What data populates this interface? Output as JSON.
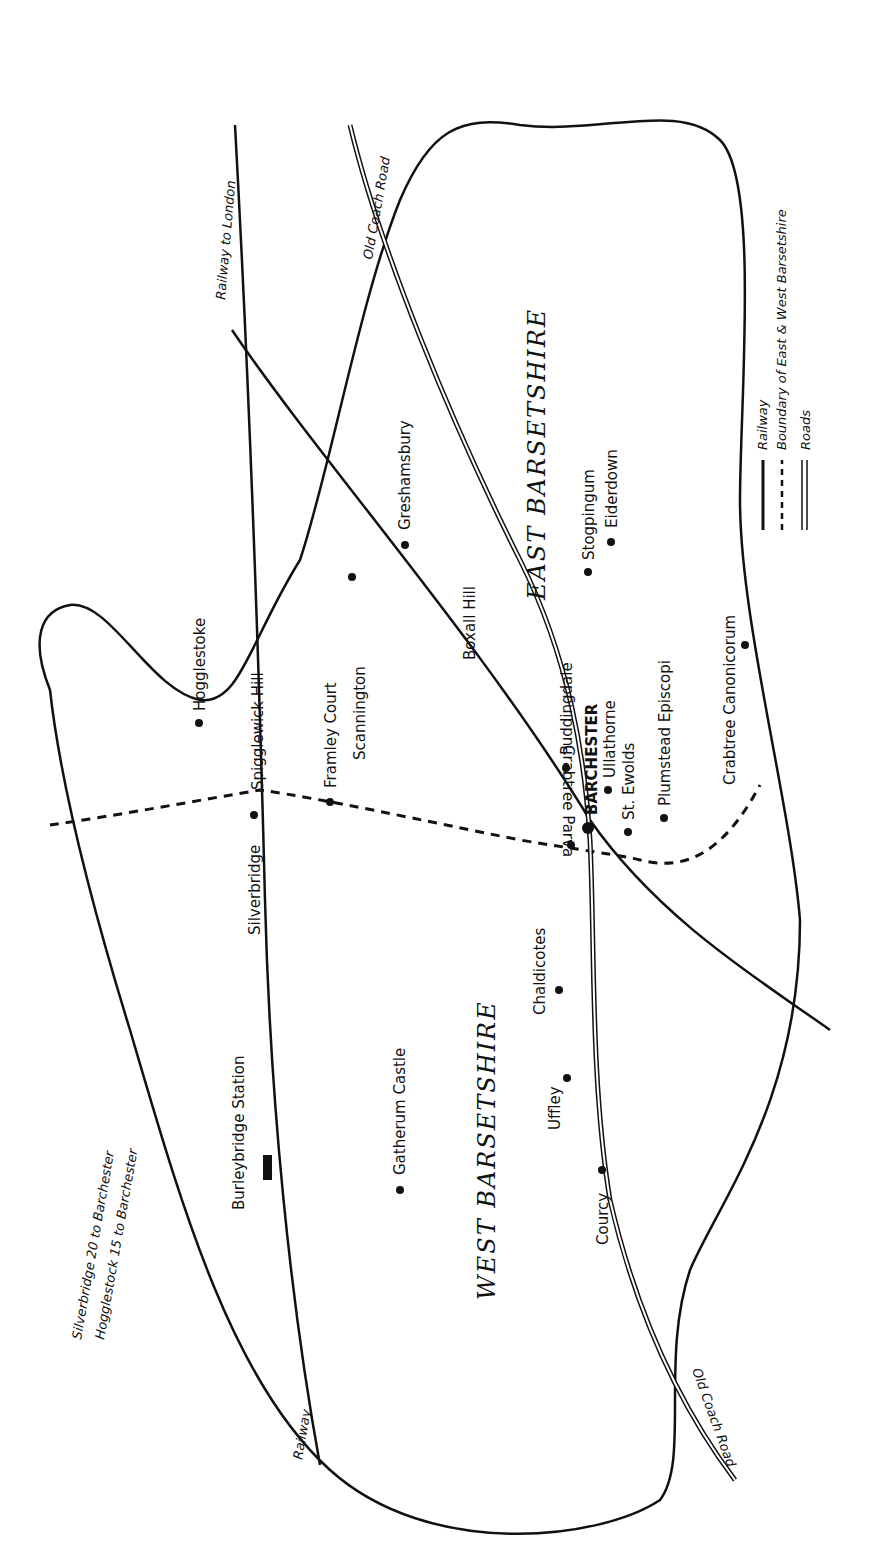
{
  "map": {
    "regions": {
      "east": "EAST BARSETSHIRE",
      "west": "WEST BARSETSHIRE"
    },
    "notes": [
      "Silverbridge  20 to Barchester",
      "Hogglestock  15 to Barchester"
    ],
    "legend": {
      "railway": "Railway",
      "boundary": "Boundary of East & West Barsetshire",
      "roads": "Roads"
    },
    "line_labels": {
      "railway_london": "Railway to London",
      "railway": "Railway",
      "old_coach_road_top": "Old Coach Road",
      "old_coach_road_bottom": "Old Coach Road"
    },
    "places": {
      "hogglestoke": "Hogglestoke",
      "spigglewick": "Spigglewick Hill",
      "framley": "Framley Court",
      "scannington": "Scannington",
      "greshamsbury": "Greshamsbury",
      "boxall": "Boxall Hill",
      "stogpingum": "Stogpingum",
      "eiderdown": "Eiderdown",
      "crabtree_canonicorum": "Crabtree Canonicorum",
      "puddingdale": "Puddingdale",
      "barchester": "BARCHESTER",
      "ullathorne": "Ullathorne",
      "st_ewolds": "St. Ewolds",
      "plumstead": "Plumstead Episcopi",
      "crabtree_parva": "Crabtree Parva",
      "silverbridge": "Silverbridge",
      "chaldicotes": "Chaldicotes",
      "uffley": "Uffley",
      "courcy": "Courcy",
      "gatherum": "Gatherum Castle",
      "burleybridge": "Burleybridge Station"
    }
  }
}
